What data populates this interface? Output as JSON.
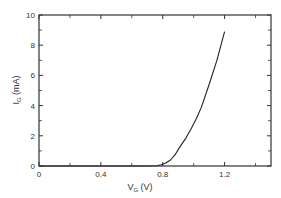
{
  "chart_data": {
    "type": "line",
    "title": "",
    "xlabel": "V",
    "xlabel_sub": "G",
    "xlabel_unit": " (V)",
    "ylabel": "I",
    "ylabel_sub": "G",
    "ylabel_unit": " (mA)",
    "xlim": [
      0,
      1.5
    ],
    "ylim": [
      0,
      10
    ],
    "x_ticks": [
      0,
      0.4,
      0.8,
      1.2
    ],
    "x_tick_labels": [
      "0",
      "0.4",
      "0.8",
      "1.2"
    ],
    "x_minor_ticks": [
      0.2,
      0.6,
      1.0,
      1.4
    ],
    "y_ticks": [
      0,
      2,
      4,
      6,
      8,
      10
    ],
    "y_tick_labels": [
      "0",
      "2",
      "4",
      "6",
      "8",
      "10"
    ],
    "y_minor_ticks": [
      1,
      3,
      5,
      7,
      9
    ],
    "grid": false,
    "legend": "none",
    "series": [
      {
        "name": "IG vs VG",
        "x": [
          0.0,
          0.7,
          0.76,
          0.79,
          0.82,
          0.85,
          0.88,
          0.91,
          0.95,
          0.98,
          1.02,
          1.05,
          1.1,
          1.15,
          1.2
        ],
        "y": [
          0.0,
          0.0,
          0.02,
          0.08,
          0.2,
          0.4,
          0.75,
          1.25,
          1.85,
          2.4,
          3.2,
          3.9,
          5.4,
          7.0,
          8.9
        ]
      }
    ]
  },
  "colors": {
    "line": "#222222",
    "axis": "#333333",
    "background": "#ffffff"
  }
}
